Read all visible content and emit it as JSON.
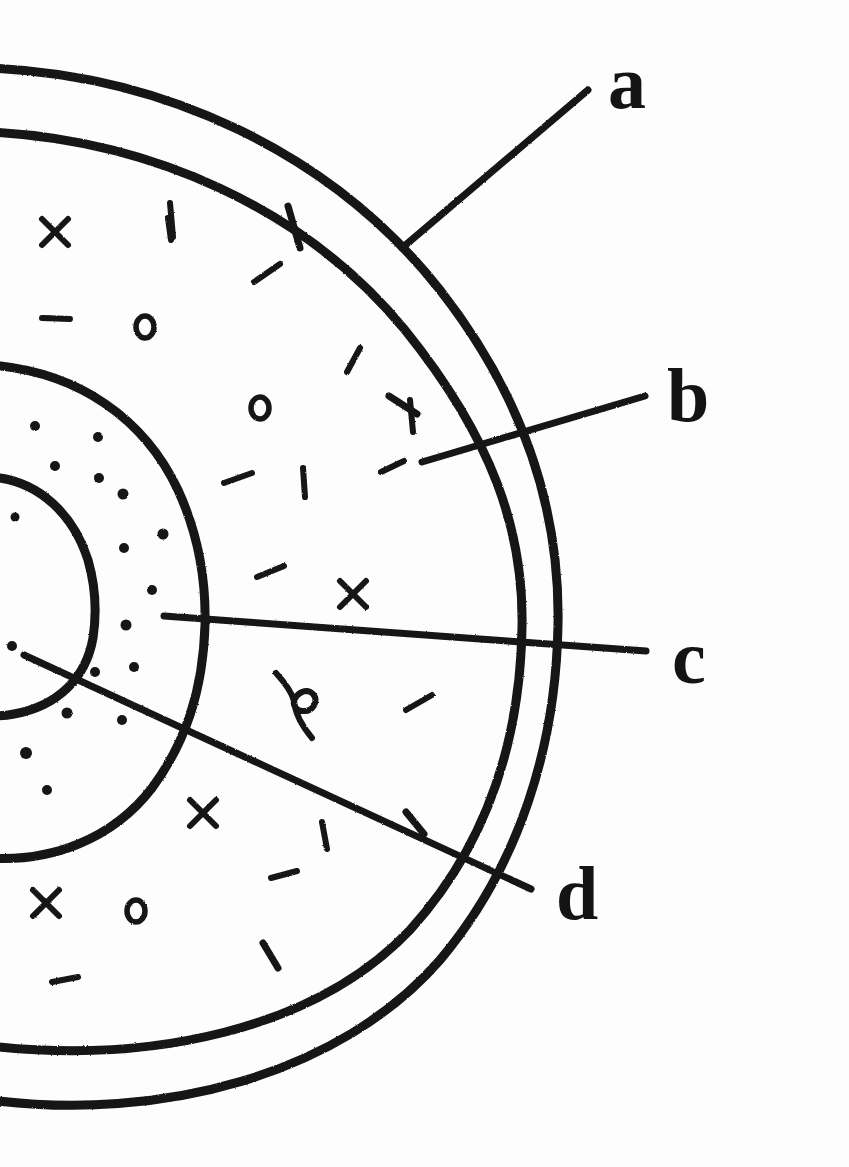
{
  "figure": {
    "style": {
      "ink_color": "#141414",
      "background_color": "#fdfdfd",
      "stroke_look": "hand-drawn ink pen",
      "label_font_style": "bold serif lowercase"
    },
    "labels": [
      {
        "id": "a",
        "text": "a",
        "x": 608,
        "y": 44,
        "points_to": "outermost-shell-band",
        "leader_line": {
          "x1": 588,
          "y1": 90,
          "x2": 402,
          "y2": 248
        }
      },
      {
        "id": "b",
        "text": "b",
        "x": 667,
        "y": 357,
        "points_to": "second-shell-arc",
        "leader_line": {
          "x1": 645,
          "y1": 396,
          "x2": 422,
          "y2": 462
        }
      },
      {
        "id": "c",
        "text": "c",
        "x": 672,
        "y": 619,
        "points_to": "stippled-inner-ring",
        "leader_line": {
          "x1": 646,
          "y1": 651,
          "x2": 164,
          "y2": 616
        }
      },
      {
        "id": "d",
        "text": "d",
        "x": 556,
        "y": 855,
        "points_to": "core-region",
        "leader_line": {
          "x1": 531,
          "y1": 889,
          "x2": 24,
          "y2": 655
        }
      }
    ],
    "regions": [
      {
        "name": "outer-rim-arc",
        "kind": "arc",
        "note": "outermost hand-drawn arc, open at the left page edge"
      },
      {
        "name": "outer-inner-arc",
        "kind": "arc",
        "note": "second arc just inside the outer rim, forming a thin band labelled a"
      },
      {
        "name": "body-outer-arc",
        "kind": "arc",
        "note": "third arc bounding the main stippled/dashed body, labelled b"
      },
      {
        "name": "body-inner-arc",
        "kind": "arc",
        "note": "fourth arc, inner boundary of the main body"
      },
      {
        "name": "stippled-ring",
        "kind": "arc-ring",
        "note": "ring filled with small round dots, labelled c"
      },
      {
        "name": "core-arc",
        "kind": "arc",
        "note": "innermost small arc enclosing the core, labelled d"
      }
    ],
    "marks": {
      "legend": [
        {
          "glyph": "x",
          "name": "cross-mark"
        },
        {
          "glyph": "|",
          "name": "vertical-dash-mark"
        },
        {
          "glyph": "−",
          "name": "horizontal-dash-mark"
        },
        {
          "glyph": "o",
          "name": "ring-mark"
        },
        {
          "glyph": "/",
          "name": "slanted-dash-mark"
        },
        {
          "glyph": "ε",
          "name": "curled-squiggle-mark"
        },
        {
          "glyph": "·",
          "name": "dot-stipple"
        }
      ],
      "counts": {
        "cross_marks": 5,
        "ring_marks": 4,
        "dash_marks": 14,
        "squiggle_marks": 1,
        "stipple_dots": 22
      }
    }
  }
}
